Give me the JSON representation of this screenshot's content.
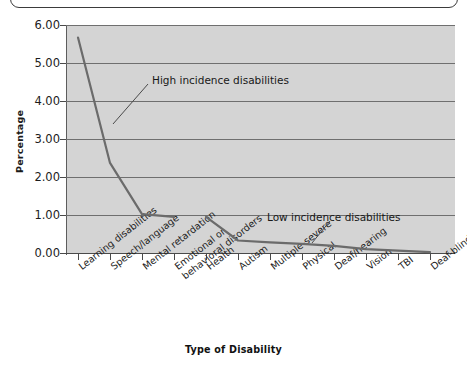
{
  "chart_data": {
    "type": "line",
    "title": "",
    "xlabel": "Type of Disability",
    "ylabel": "Percentage",
    "ylim": [
      0.0,
      6.0
    ],
    "yticks": [
      "0.00",
      "1.00",
      "2.00",
      "3.00",
      "4.00",
      "5.00",
      "6.00"
    ],
    "ytick_values": [
      0,
      1,
      2,
      3,
      4,
      5,
      6
    ],
    "grid": "horizontal",
    "legend": "none",
    "categories": [
      "Learning disabilities",
      "Speech/language",
      "Mental retardation",
      "Emotional or behavioral disorders",
      "Health",
      "Autism",
      "Multiple-severe",
      "Physical",
      "Deaf/hearing",
      "Vision",
      "TBI",
      "Deaf-blindness"
    ],
    "values": [
      5.67,
      2.37,
      1.02,
      0.95,
      0.95,
      0.33,
      0.28,
      0.24,
      0.19,
      0.1,
      0.06,
      0.02
    ],
    "series": [
      {
        "name": "Percentage of students",
        "values": [
          5.67,
          2.37,
          1.02,
          0.95,
          0.95,
          0.33,
          0.28,
          0.24,
          0.19,
          0.1,
          0.06,
          0.02
        ]
      }
    ],
    "annotations": [
      {
        "text": "High incidence disabilities",
        "points_to_category": "Speech/language"
      },
      {
        "text": "Low incidence disabilities",
        "points_to_category": "Physical"
      }
    ],
    "line_color": "#6b6b6b",
    "plot_background": "#d4d4d4",
    "gridline_color": "#6f6f6f"
  }
}
